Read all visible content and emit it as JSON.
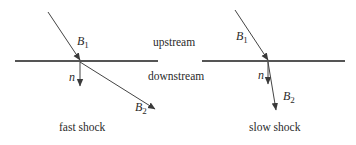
{
  "colors": {
    "line": "#4a4a4a",
    "text": "#2a2a2a",
    "background": "#ffffff"
  },
  "regions": {
    "upstream": "upstream",
    "downstream": "downstream"
  },
  "panels": [
    {
      "id": "fast",
      "caption": "fast shock",
      "labels": {
        "b1_base": "B",
        "b1_sub": "1",
        "n": "n",
        "b2_base": "B",
        "b2_sub": "2"
      }
    },
    {
      "id": "slow",
      "caption": "slow shock",
      "labels": {
        "b1_base": "B",
        "b1_sub": "1",
        "n": "n",
        "b2_base": "B",
        "b2_sub": "2"
      }
    }
  ]
}
